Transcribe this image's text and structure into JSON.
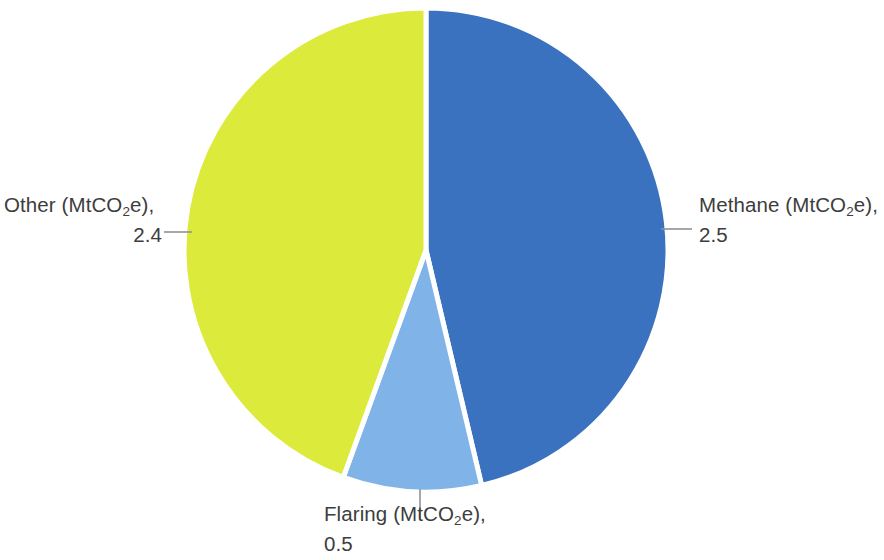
{
  "chart_data": {
    "type": "pie",
    "title": "",
    "unit": "MtCO2e",
    "total": 5.4,
    "categories": [
      "Methane (MtCO2e)",
      "Flaring (MtCO2e)",
      "Other (MtCO2e)"
    ],
    "values": [
      2.5,
      0.5,
      2.4
    ],
    "colors": [
      "#3a72bf",
      "#80b4e8",
      "#dcea3c"
    ],
    "legend": "none",
    "grid": false,
    "labels": [
      {
        "key": "methane",
        "name_prefix": "Methane (MtCO",
        "name_subscript": "2",
        "name_suffix": "e),",
        "value": "2.5",
        "color": "#3a72bf",
        "position": "right"
      },
      {
        "key": "flaring",
        "name_prefix": "Flaring (MtCO",
        "name_subscript": "2",
        "name_suffix": "e),",
        "value": "0.5",
        "color": "#80b4e8",
        "position": "bottom"
      },
      {
        "key": "other",
        "name_prefix": "Other (MtCO",
        "name_subscript": "2",
        "name_suffix": "e),",
        "value": "2.4",
        "color": "#dcea3c",
        "position": "left"
      }
    ],
    "slices": [
      {
        "key": "methane",
        "label": "Methane (MtCO2e)",
        "value": 2.5,
        "color": "#3a72bf",
        "start_angle_deg": 0,
        "end_angle_deg": 166.7,
        "percent": 46.3
      },
      {
        "key": "flaring",
        "label": "Flaring (MtCO2e)",
        "value": 0.5,
        "color": "#80b4e8",
        "start_angle_deg": 166.7,
        "end_angle_deg": 200.0,
        "percent": 9.3
      },
      {
        "key": "other",
        "label": "Other (MtCO2e)",
        "value": 2.4,
        "color": "#dcea3c",
        "start_angle_deg": 200.0,
        "end_angle_deg": 360.0,
        "percent": 44.4
      }
    ],
    "geometry": {
      "center_x": 426,
      "center_y": 250,
      "radius": 242,
      "separator_color": "#ffffff",
      "separator_width": 5,
      "leader_color": "#8f9396"
    }
  }
}
